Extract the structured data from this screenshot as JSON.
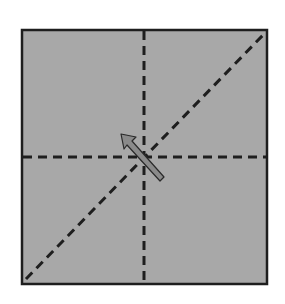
{
  "diagram": {
    "type": "folding-instruction",
    "paper": {
      "x": 22,
      "y": 30,
      "width": 245,
      "height": 254,
      "fill": "#a8a8a8",
      "stroke": "#1e1e1e"
    },
    "fold_lines": [
      {
        "name": "vertical-center",
        "x1": 144,
        "y1": 31,
        "x2": 144,
        "y2": 283
      },
      {
        "name": "horizontal-center",
        "x1": 23,
        "y1": 157,
        "x2": 266,
        "y2": 157
      },
      {
        "name": "diagonal",
        "x1": 26,
        "y1": 279,
        "x2": 265,
        "y2": 33
      }
    ],
    "arrow": {
      "from": [
        164,
        180
      ],
      "to": [
        121,
        134
      ],
      "fill": "#8a8a8a",
      "stroke": "#2a2a2a"
    },
    "colors": {
      "background": "#ffffff",
      "paper": "#a8a8a8",
      "line": "#1e1e1e"
    }
  }
}
